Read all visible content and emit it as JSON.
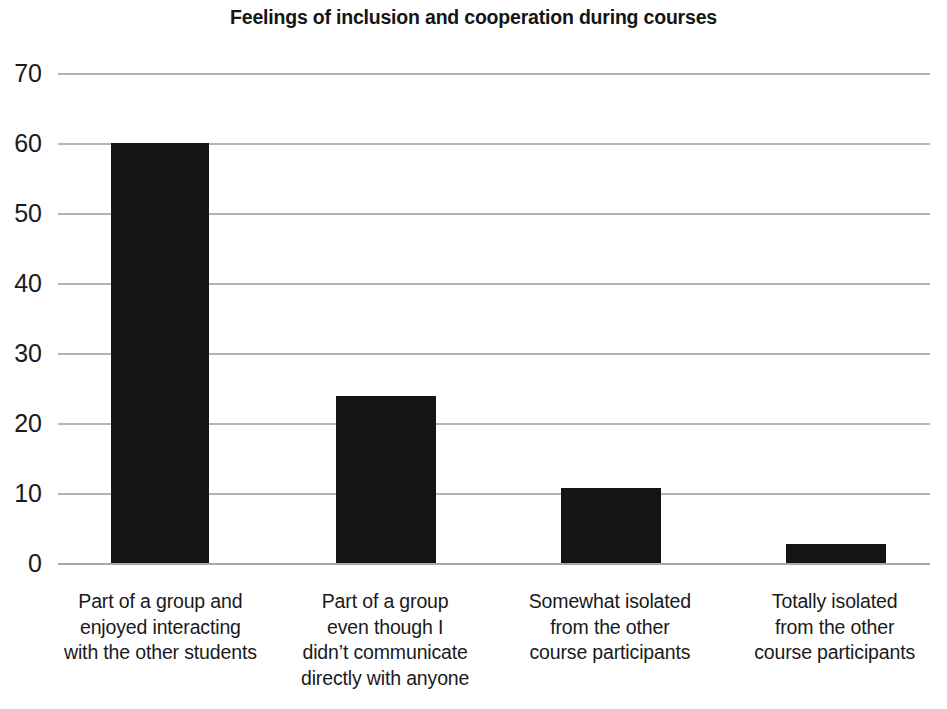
{
  "chart_data": {
    "type": "bar",
    "title": "Feelings of inclusion and cooperation during courses",
    "xlabel": "",
    "ylabel": "",
    "ylim": [
      0,
      70
    ],
    "yticks": [
      0,
      10,
      20,
      30,
      40,
      50,
      60,
      70
    ],
    "grid": true,
    "legend": false,
    "bar_color": "#141414",
    "gridline_color": "#b4b4b4",
    "background_color": "#ffffff",
    "categories": [
      "Part of a group and enjoyed interacting with the other students",
      "Part of a group even though I didn’t communicate directly with anyone",
      "Somewhat isolated from the other course participants",
      "Totally isolated from the other course participants"
    ],
    "category_lines": [
      [
        "Part of a group and",
        "enjoyed interacting",
        "with the other students"
      ],
      [
        "Part of a group",
        "even though I",
        "didn’t communicate",
        "directly with anyone"
      ],
      [
        "Somewhat isolated",
        "from the other",
        "course participants"
      ],
      [
        "Totally isolated",
        "from the other",
        "course participants"
      ]
    ],
    "values": [
      60,
      24,
      11,
      3
    ]
  },
  "ticks": {
    "t0": "0",
    "t10": "10",
    "t20": "20",
    "t30": "30",
    "t40": "40",
    "t50": "50",
    "t60": "60",
    "t70": "70"
  },
  "labels": {
    "cat1_l1": "Part of a group and",
    "cat1_l2": "enjoyed interacting",
    "cat1_l3": "with the other students",
    "cat2_l1": "Part of a group",
    "cat2_l2": "even though I",
    "cat2_l3": "didn’t communicate",
    "cat2_l4": "directly with anyone",
    "cat3_l1": "Somewhat isolated",
    "cat3_l2": "from the other",
    "cat3_l3": "course participants",
    "cat4_l1": "Totally isolated",
    "cat4_l2": "from the other",
    "cat4_l3": "course participants"
  }
}
